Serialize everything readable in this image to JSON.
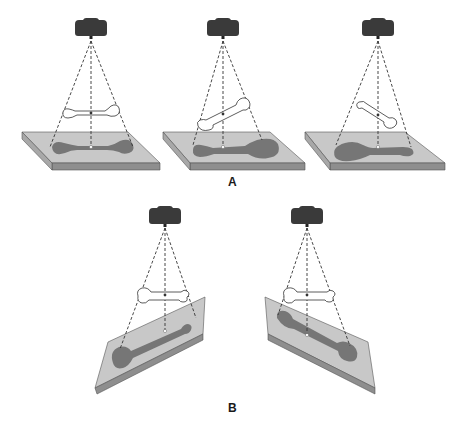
{
  "figure": {
    "colors": {
      "plate_top": "#c8c8c8",
      "plate_edge": "#8e8e8e",
      "shadow": "#767676",
      "source": "#3a3a3a",
      "bone_fill": "#ffffff",
      "bone_stroke": "#333333",
      "beam": "#333333"
    }
  },
  "panels": {
    "A": {
      "label": "A",
      "items": [
        {
          "name": "bone-parallel-centered",
          "note": "bone parallel to plate, shadow undistorted"
        },
        {
          "name": "bone-tilted-right-up",
          "note": "distal end raised, shadow enlarged at right"
        },
        {
          "name": "bone-tilted-left-up",
          "note": "proximal end raised, shadow enlarged at left"
        }
      ]
    },
    "B": {
      "label": "B",
      "items": [
        {
          "name": "plate-tilted-left-low",
          "note": "plate tilted, bone horizontal"
        },
        {
          "name": "plate-tilted-right-low",
          "note": "plate tilted opposite direction"
        }
      ]
    }
  }
}
